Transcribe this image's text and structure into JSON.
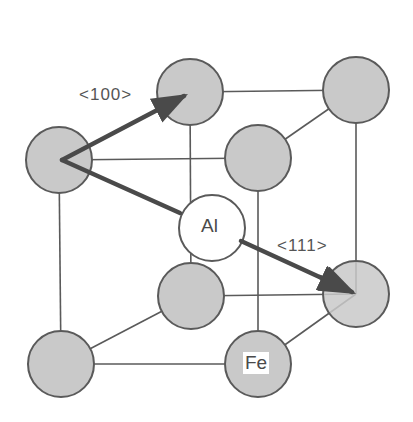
{
  "figure": {
    "type": "crystal-structure",
    "colors": {
      "fe_atom_fill": "#c9c9c9",
      "al_atom_fill": "#ffffff",
      "edge": "#5a5a5a",
      "vector": "#4a4a4a"
    }
  },
  "labels": {
    "direction_100": "<100>",
    "direction_111": "<111>",
    "atom_al": "Al",
    "atom_fe": "Fe"
  },
  "atoms": [
    {
      "id": "back-top-left",
      "element": "Fe",
      "x": 190,
      "y": 92
    },
    {
      "id": "back-top-right",
      "element": "Fe",
      "x": 356,
      "y": 90
    },
    {
      "id": "front-top-left",
      "element": "Fe",
      "x": 59,
      "y": 160
    },
    {
      "id": "front-top-right",
      "element": "Fe",
      "x": 258,
      "y": 158
    },
    {
      "id": "back-bottom-left",
      "element": "Fe",
      "x": 191,
      "y": 296
    },
    {
      "id": "back-bottom-right",
      "element": "Fe",
      "x": 356,
      "y": 294
    },
    {
      "id": "front-bottom-left",
      "element": "Fe",
      "x": 61,
      "y": 364
    },
    {
      "id": "front-bottom-right",
      "element": "Fe",
      "x": 258,
      "y": 364
    },
    {
      "id": "body-center",
      "element": "Al",
      "x": 212,
      "y": 228
    }
  ],
  "vectors": [
    {
      "label": "<100>",
      "from": "front-top-left",
      "to": "back-top-left"
    },
    {
      "label": "<111>",
      "from": "front-top-left",
      "to": "back-bottom-right"
    }
  ]
}
